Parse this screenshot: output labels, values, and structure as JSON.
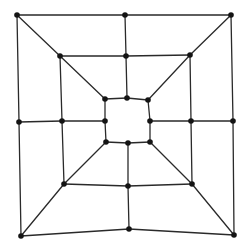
{
  "diagram": {
    "type": "graph",
    "colors": {
      "edge": "#2a2a2a",
      "node": "#141414",
      "background": "#ffffff"
    },
    "nodes": [
      {
        "id": "o-tl",
        "x": 17,
        "y": 15
      },
      {
        "id": "o-tm",
        "x": 125,
        "y": 15
      },
      {
        "id": "o-tr",
        "x": 231,
        "y": 15
      },
      {
        "id": "o-ml",
        "x": 19,
        "y": 122
      },
      {
        "id": "o-mr",
        "x": 233,
        "y": 121
      },
      {
        "id": "o-bl",
        "x": 21,
        "y": 236
      },
      {
        "id": "o-bm",
        "x": 129,
        "y": 229
      },
      {
        "id": "o-br",
        "x": 234,
        "y": 235
      },
      {
        "id": "m-tl",
        "x": 60,
        "y": 56
      },
      {
        "id": "m-tm",
        "x": 126,
        "y": 56
      },
      {
        "id": "m-tr",
        "x": 190,
        "y": 55
      },
      {
        "id": "m-ml",
        "x": 62,
        "y": 121
      },
      {
        "id": "m-mr",
        "x": 191,
        "y": 121
      },
      {
        "id": "m-bl",
        "x": 64,
        "y": 184
      },
      {
        "id": "m-bm",
        "x": 128,
        "y": 186
      },
      {
        "id": "m-br",
        "x": 192,
        "y": 184
      },
      {
        "id": "i-tl",
        "x": 105,
        "y": 99
      },
      {
        "id": "i-tm",
        "x": 127,
        "y": 98
      },
      {
        "id": "i-tr",
        "x": 148,
        "y": 100
      },
      {
        "id": "i-ml",
        "x": 105,
        "y": 121
      },
      {
        "id": "i-mr",
        "x": 150,
        "y": 121
      },
      {
        "id": "i-bl",
        "x": 106,
        "y": 142
      },
      {
        "id": "i-bm",
        "x": 128,
        "y": 143
      },
      {
        "id": "i-br",
        "x": 150,
        "y": 142
      }
    ],
    "edges": [
      [
        "o-tl",
        "o-tm"
      ],
      [
        "o-tm",
        "o-tr"
      ],
      [
        "o-tr",
        "o-mr"
      ],
      [
        "o-mr",
        "o-br"
      ],
      [
        "o-br",
        "o-bm"
      ],
      [
        "o-bm",
        "o-bl"
      ],
      [
        "o-bl",
        "o-ml"
      ],
      [
        "o-ml",
        "o-tl"
      ],
      [
        "m-tl",
        "m-tm"
      ],
      [
        "m-tm",
        "m-tr"
      ],
      [
        "m-tr",
        "m-mr"
      ],
      [
        "m-mr",
        "m-br"
      ],
      [
        "m-br",
        "m-bm"
      ],
      [
        "m-bm",
        "m-bl"
      ],
      [
        "m-bl",
        "m-ml"
      ],
      [
        "m-ml",
        "m-tl"
      ],
      [
        "i-tl",
        "i-tm"
      ],
      [
        "i-tm",
        "i-tr"
      ],
      [
        "i-tr",
        "i-mr"
      ],
      [
        "i-mr",
        "i-br"
      ],
      [
        "i-br",
        "i-bm"
      ],
      [
        "i-bm",
        "i-bl"
      ],
      [
        "i-bl",
        "i-ml"
      ],
      [
        "i-ml",
        "i-tl"
      ],
      [
        "o-tl",
        "m-tl"
      ],
      [
        "m-tl",
        "i-tl"
      ],
      [
        "o-tr",
        "m-tr"
      ],
      [
        "m-tr",
        "i-tr"
      ],
      [
        "o-bl",
        "m-bl"
      ],
      [
        "m-bl",
        "i-bl"
      ],
      [
        "o-br",
        "m-br"
      ],
      [
        "m-br",
        "i-br"
      ],
      [
        "o-tm",
        "m-tm"
      ],
      [
        "m-tm",
        "i-tm"
      ],
      [
        "o-bm",
        "m-bm"
      ],
      [
        "m-bm",
        "i-bm"
      ],
      [
        "o-ml",
        "m-ml"
      ],
      [
        "m-ml",
        "i-ml"
      ],
      [
        "o-mr",
        "m-mr"
      ],
      [
        "m-mr",
        "i-mr"
      ]
    ]
  }
}
